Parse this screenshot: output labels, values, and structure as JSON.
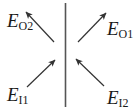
{
  "diagram": {
    "colors": {
      "line": "#333333",
      "text": "#1a1a1a",
      "background": "#ffffff"
    },
    "interface": {
      "x": 65.5,
      "y1": 3,
      "y2": 107
    },
    "vectors": [
      {
        "id": "E_O2",
        "main": "E",
        "sub": "O2",
        "tail": [
          54,
          42
        ],
        "head": [
          26,
          12
        ],
        "label_pos": [
          7,
          27
        ],
        "direction": "up-left"
      },
      {
        "id": "E_O1",
        "main": "E",
        "sub": "O1",
        "tail": [
          78,
          42
        ],
        "head": [
          106,
          13
        ],
        "label_pos": [
          107,
          35
        ],
        "direction": "up-right"
      },
      {
        "id": "E_I1",
        "main": "E",
        "sub": "I1",
        "tail": [
          27,
          87
        ],
        "head": [
          55,
          60
        ],
        "label_pos": [
          7,
          101
        ],
        "direction": "up-right"
      },
      {
        "id": "E_I2",
        "main": "E",
        "sub": "I2",
        "tail": [
          104,
          86
        ],
        "head": [
          76,
          59
        ],
        "label_pos": [
          107,
          104
        ],
        "direction": "up-left"
      }
    ]
  }
}
